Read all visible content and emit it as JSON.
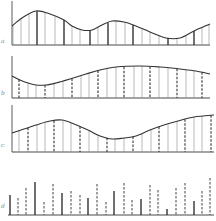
{
  "figure": {
    "panels": [
      {
        "label": "a",
        "type": "continuous-with-samples",
        "baseline_y": 45,
        "axis_x": 12,
        "x_end": 210,
        "curve": [
          [
            12,
            26
          ],
          [
            22,
            18
          ],
          [
            36,
            11
          ],
          [
            50,
            14
          ],
          [
            64,
            20
          ],
          [
            72,
            26
          ],
          [
            82,
            30
          ],
          [
            92,
            30
          ],
          [
            102,
            25
          ],
          [
            112,
            21
          ],
          [
            124,
            22
          ],
          [
            136,
            26
          ],
          [
            150,
            32
          ],
          [
            166,
            38
          ],
          [
            180,
            38
          ],
          [
            194,
            31
          ],
          [
            210,
            24
          ]
        ],
        "samples": [
          {
            "x": 13,
            "style": "thin"
          },
          {
            "x": 21,
            "style": "thin"
          },
          {
            "x": 29,
            "style": "thin"
          },
          {
            "x": 37,
            "style": "bold"
          },
          {
            "x": 45,
            "style": "thin"
          },
          {
            "x": 55,
            "style": "thin"
          },
          {
            "x": 64,
            "style": "bold"
          },
          {
            "x": 72,
            "style": "thin"
          },
          {
            "x": 80,
            "style": "thin"
          },
          {
            "x": 90,
            "style": "bold"
          },
          {
            "x": 98,
            "style": "thin"
          },
          {
            "x": 108,
            "style": "bold"
          },
          {
            "x": 116,
            "style": "thin"
          },
          {
            "x": 125,
            "style": "thin"
          },
          {
            "x": 133,
            "style": "bold"
          },
          {
            "x": 142,
            "style": "thin"
          },
          {
            "x": 150,
            "style": "thin"
          },
          {
            "x": 159,
            "style": "thin"
          },
          {
            "x": 168,
            "style": "bold"
          },
          {
            "x": 177,
            "style": "thin"
          },
          {
            "x": 186,
            "style": "thin"
          },
          {
            "x": 194,
            "style": "bold"
          },
          {
            "x": 202,
            "style": "thin"
          },
          {
            "x": 209,
            "style": "thin"
          }
        ]
      },
      {
        "label": "b",
        "type": "continuous-with-samples",
        "baseline_y": 98,
        "axis_x": 12,
        "x_end": 210,
        "curve": [
          [
            12,
            76
          ],
          [
            20,
            80
          ],
          [
            28,
            83
          ],
          [
            36,
            85
          ],
          [
            46,
            85
          ],
          [
            56,
            83
          ],
          [
            70,
            79
          ],
          [
            86,
            74
          ],
          [
            100,
            70
          ],
          [
            116,
            67
          ],
          [
            140,
            66
          ],
          [
            160,
            67
          ],
          [
            180,
            69
          ],
          [
            196,
            71
          ],
          [
            210,
            74
          ]
        ],
        "samples": [
          {
            "x": 19,
            "style": "dashed"
          },
          {
            "x": 28,
            "style": "thin"
          },
          {
            "x": 36,
            "style": "thin"
          },
          {
            "x": 45,
            "style": "dashed"
          },
          {
            "x": 54,
            "style": "thin"
          },
          {
            "x": 63,
            "style": "thin"
          },
          {
            "x": 72,
            "style": "dashed"
          },
          {
            "x": 81,
            "style": "thin"
          },
          {
            "x": 89,
            "style": "thin"
          },
          {
            "x": 98,
            "style": "dashed"
          },
          {
            "x": 107,
            "style": "thin"
          },
          {
            "x": 116,
            "style": "thin"
          },
          {
            "x": 124,
            "style": "dashed"
          },
          {
            "x": 134,
            "style": "thin"
          },
          {
            "x": 142,
            "style": "thin"
          },
          {
            "x": 150,
            "style": "dashed"
          },
          {
            "x": 159,
            "style": "thin"
          },
          {
            "x": 168,
            "style": "thin"
          },
          {
            "x": 177,
            "style": "dashed"
          },
          {
            "x": 186,
            "style": "thin"
          },
          {
            "x": 194,
            "style": "thin"
          },
          {
            "x": 202,
            "style": "dashed"
          }
        ]
      },
      {
        "label": "c",
        "type": "continuous-with-samples",
        "baseline_y": 152,
        "axis_x": 12,
        "x_end": 214,
        "curve": [
          [
            12,
            133
          ],
          [
            24,
            129
          ],
          [
            36,
            125
          ],
          [
            50,
            121
          ],
          [
            62,
            120
          ],
          [
            74,
            124
          ],
          [
            88,
            130
          ],
          [
            100,
            136
          ],
          [
            112,
            139
          ],
          [
            124,
            138
          ],
          [
            136,
            136
          ],
          [
            150,
            130
          ],
          [
            164,
            125
          ],
          [
            178,
            121
          ],
          [
            194,
            117
          ],
          [
            214,
            115
          ]
        ],
        "samples": [
          {
            "x": 19,
            "style": "thin"
          },
          {
            "x": 28,
            "style": "dashed"
          },
          {
            "x": 37,
            "style": "thin"
          },
          {
            "x": 45,
            "style": "thin"
          },
          {
            "x": 54,
            "style": "dashed"
          },
          {
            "x": 63,
            "style": "thin"
          },
          {
            "x": 71,
            "style": "thin"
          },
          {
            "x": 80,
            "style": "dashed"
          },
          {
            "x": 89,
            "style": "thin"
          },
          {
            "x": 98,
            "style": "thin"
          },
          {
            "x": 107,
            "style": "dashed"
          },
          {
            "x": 115,
            "style": "thin"
          },
          {
            "x": 124,
            "style": "thin"
          },
          {
            "x": 133,
            "style": "dashed"
          },
          {
            "x": 142,
            "style": "thin"
          },
          {
            "x": 151,
            "style": "thin"
          },
          {
            "x": 159,
            "style": "dashed"
          },
          {
            "x": 168,
            "style": "thin"
          },
          {
            "x": 177,
            "style": "thin"
          },
          {
            "x": 185,
            "style": "dashed"
          },
          {
            "x": 194,
            "style": "thin"
          },
          {
            "x": 202,
            "style": "thin"
          },
          {
            "x": 211,
            "style": "dashed"
          }
        ]
      },
      {
        "label": "d",
        "type": "impulse-sequence",
        "baseline_y": 215,
        "axis_x": 8,
        "x_end": 214,
        "impulses": [
          {
            "x": 10,
            "h": 20,
            "style": "solid"
          },
          {
            "x": 18,
            "h": 17,
            "style": "dashed"
          },
          {
            "x": 26,
            "h": 27,
            "style": "dashed"
          },
          {
            "x": 35,
            "h": 33,
            "style": "solid"
          },
          {
            "x": 44,
            "h": 13,
            "style": "dashed"
          },
          {
            "x": 53,
            "h": 31,
            "style": "dashed"
          },
          {
            "x": 62,
            "h": 22,
            "style": "solid"
          },
          {
            "x": 71,
            "h": 24,
            "style": "dashed"
          },
          {
            "x": 80,
            "h": 20,
            "style": "dashed"
          },
          {
            "x": 88,
            "h": 17,
            "style": "solid"
          },
          {
            "x": 97,
            "h": 31,
            "style": "dashed"
          },
          {
            "x": 106,
            "h": 13,
            "style": "dashed"
          },
          {
            "x": 114,
            "h": 24,
            "style": "solid"
          },
          {
            "x": 124,
            "h": 32,
            "style": "dashed"
          },
          {
            "x": 132,
            "h": 15,
            "style": "dashed"
          },
          {
            "x": 141,
            "h": 16,
            "style": "solid"
          },
          {
            "x": 150,
            "h": 30,
            "style": "dashed"
          },
          {
            "x": 158,
            "h": 25,
            "style": "dashed"
          },
          {
            "x": 167,
            "h": 6,
            "style": "solid"
          },
          {
            "x": 176,
            "h": 27,
            "style": "dashed"
          },
          {
            "x": 185,
            "h": 32,
            "style": "dashed"
          },
          {
            "x": 194,
            "h": 14,
            "style": "solid"
          },
          {
            "x": 202,
            "h": 24,
            "style": "dashed"
          },
          {
            "x": 210,
            "h": 37,
            "style": "dashed"
          }
        ]
      }
    ],
    "colors": {
      "ink": "#333333",
      "thin_line": "#8a8a8a",
      "background": "#ffffff"
    }
  }
}
